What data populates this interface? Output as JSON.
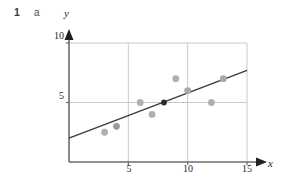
{
  "header": {
    "question_number": "1",
    "part_label": "a"
  },
  "chart_data": {
    "type": "scatter",
    "title": "",
    "xlabel": "x",
    "ylabel": "y",
    "xlim": [
      0,
      15
    ],
    "ylim": [
      0,
      10
    ],
    "xticks": [
      5,
      10,
      15
    ],
    "yticks": [
      5,
      10
    ],
    "grid": true,
    "legend": false,
    "points": [
      {
        "x": 3,
        "y": 2.5,
        "color": "#b0b0b0",
        "role": "data"
      },
      {
        "x": 4,
        "y": 3,
        "color": "#9a9a9a",
        "role": "data"
      },
      {
        "x": 6,
        "y": 5,
        "color": "#b0b0b0",
        "role": "data"
      },
      {
        "x": 7,
        "y": 4,
        "color": "#b0b0b0",
        "role": "data"
      },
      {
        "x": 8,
        "y": 5,
        "color": "#2b2b2b",
        "role": "mean-point"
      },
      {
        "x": 9,
        "y": 7,
        "color": "#b0b0b0",
        "role": "data"
      },
      {
        "x": 10,
        "y": 6,
        "color": "#a8a8a8",
        "role": "data"
      },
      {
        "x": 12,
        "y": 5,
        "color": "#b0b0b0",
        "role": "data"
      },
      {
        "x": 13,
        "y": 7,
        "color": "#a8a8a8",
        "role": "data"
      }
    ],
    "line_of_best_fit": {
      "x1": 0,
      "y1": 2.0,
      "x2": 15,
      "y2": 7.7,
      "color": "#3a3a3a"
    },
    "colors": {
      "axis": "#6b6b6b",
      "grid": "#c9c9c9",
      "point": "#b0b0b0",
      "mean_point": "#2b2b2b",
      "line": "#3a3a3a",
      "text": "#1f1f1f",
      "background": "#ffffff"
    }
  }
}
